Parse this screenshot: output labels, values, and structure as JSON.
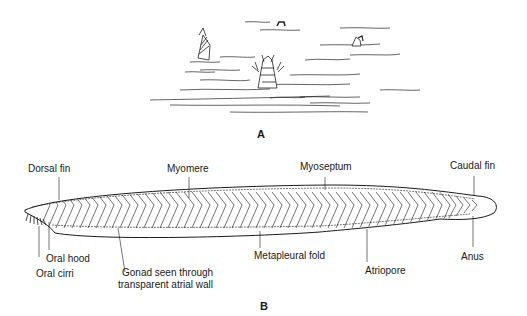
{
  "figure": {
    "panel_a": {
      "label": "A",
      "description": "Lancelets partially buried in sand with anterior ends protruding"
    },
    "panel_b": {
      "label": "B",
      "description": "Lateral view of lancelet (amphioxus) anatomy",
      "labels": {
        "dorsal_fin": "Dorsal fin",
        "myomere": "Myomere",
        "myoseptum": "Myoseptum",
        "caudal_fin": "Caudal fin",
        "oral_hood": "Oral hood",
        "oral_cirri": "Oral cirri",
        "gonad_line1": "Gonad seen through",
        "gonad_line2": "transparent atrial wall",
        "metapleural_fold": "Metapleural fold",
        "atriopore": "Atriopore",
        "anus": "Anus"
      }
    }
  },
  "colors": {
    "ink": "#1a1a1a",
    "background": "#ffffff"
  }
}
